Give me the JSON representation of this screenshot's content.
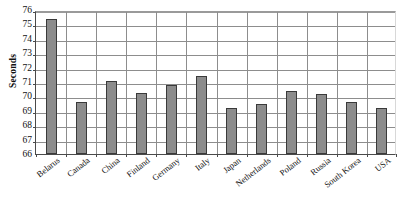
{
  "chart_data": {
    "type": "bar",
    "title": "",
    "subtitle": "",
    "xlabel": "",
    "ylabel": "Seconds",
    "ylim": [
      66,
      76
    ],
    "yticks": [
      66,
      67,
      68,
      69,
      70,
      71,
      72,
      73,
      74,
      75,
      76
    ],
    "ytick_labels": [
      "66",
      "67",
      "68",
      "69",
      "70",
      "71",
      "72",
      "73",
      "74",
      "75",
      "76"
    ],
    "grid": true,
    "legend": false,
    "legend_position": "none",
    "bar_color": "#8c8c8c",
    "bar_edge_color": "#3a3a3a",
    "gridline_color": "#8d8d8d",
    "axis_color": "#4a4a4a",
    "categories": [
      "Belarus",
      "Canada",
      "China",
      "Finland",
      "Germany",
      "Italy",
      "Japan",
      "Netherlands",
      "Poland",
      "Russia",
      "South Korea",
      "USA"
    ],
    "values": [
      75.35,
      69.6,
      71.05,
      70.25,
      70.8,
      71.4,
      69.2,
      69.5,
      70.4,
      70.15,
      69.6,
      69.2
    ]
  }
}
